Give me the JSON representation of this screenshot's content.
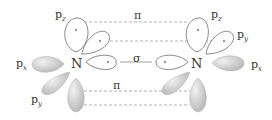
{
  "diagram": {
    "title": "",
    "atoms": [
      {
        "symbol": "N",
        "side": "left"
      },
      {
        "symbol": "N",
        "side": "right"
      }
    ],
    "orbital_labels": {
      "left": {
        "top": {
          "p": "p",
          "sub": "z"
        },
        "left": {
          "p": "p",
          "sub": "x"
        },
        "bottom": {
          "p": "p",
          "sub": "y"
        }
      },
      "right": {
        "top": {
          "p": "p",
          "sub": "z"
        },
        "right_upper": {
          "p": "p",
          "sub": "y"
        },
        "right": {
          "p": "p",
          "sub": "x"
        }
      }
    },
    "bonds": {
      "pi_top": "π",
      "sigma": "σ",
      "pi_bottom": "π"
    },
    "colors": {
      "outline": "#8a8a8a",
      "filled_lobe": "#c8c8c8",
      "dashed": "#a0a0a0"
    }
  }
}
